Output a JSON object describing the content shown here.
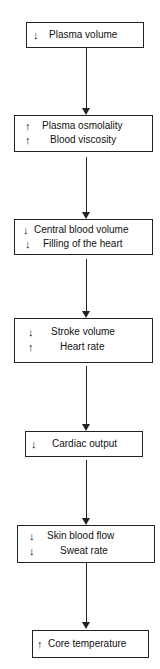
{
  "flowchart": {
    "nodes": [
      {
        "id": "plasma-volume",
        "lines": [
          {
            "arrow": "↓",
            "direction": "down",
            "text": "Plasma volume"
          }
        ]
      },
      {
        "id": "osmolality-viscosity",
        "lines": [
          {
            "arrow": "↑",
            "direction": "up",
            "text": "Plasma osmolality"
          },
          {
            "arrow": "↑",
            "direction": "up",
            "text": "Blood viscosity"
          }
        ]
      },
      {
        "id": "central-blood-volume",
        "lines": [
          {
            "arrow": "↓",
            "direction": "down",
            "text": "Central blood volume"
          },
          {
            "arrow": "↓",
            "direction": "down",
            "text": "Filling of the heart"
          }
        ]
      },
      {
        "id": "stroke-heart",
        "lines": [
          {
            "arrow": "↓",
            "direction": "down",
            "text": "Stroke volume"
          },
          {
            "arrow": "↑",
            "direction": "up",
            "text": "Heart rate"
          }
        ]
      },
      {
        "id": "cardiac-output",
        "lines": [
          {
            "arrow": "↓",
            "direction": "down",
            "text": "Cardiac output"
          }
        ]
      },
      {
        "id": "skin-sweat",
        "lines": [
          {
            "arrow": "↓",
            "direction": "down",
            "text": "Skin blood flow"
          },
          {
            "arrow": "↓",
            "direction": "down",
            "text": "Sweat rate"
          }
        ]
      },
      {
        "id": "core-temperature",
        "lines": [
          {
            "arrow": "↑",
            "direction": "up",
            "text": "Core temperature"
          }
        ]
      }
    ],
    "edges": [
      [
        "plasma-volume",
        "osmolality-viscosity"
      ],
      [
        "osmolality-viscosity",
        "central-blood-volume"
      ],
      [
        "central-blood-volume",
        "stroke-heart"
      ],
      [
        "stroke-heart",
        "cardiac-output"
      ],
      [
        "cardiac-output",
        "skin-sweat"
      ],
      [
        "skin-sweat",
        "core-temperature"
      ]
    ]
  }
}
